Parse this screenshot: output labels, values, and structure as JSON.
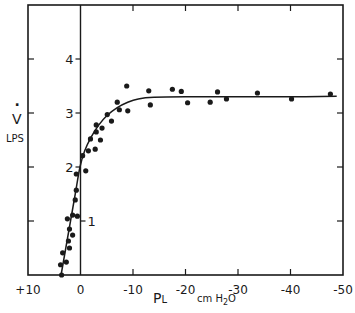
{
  "chart_data": {
    "type": "scatter",
    "title": "",
    "xlabel": "PL",
    "xlabel_subscript_note": "P with subscript L",
    "xunit": "cm H2O",
    "ylabel": "V̇",
    "yunit": "LPS",
    "xlim": [
      10,
      -50
    ],
    "ylim": [
      0,
      5
    ],
    "x_ticks": [
      10,
      0,
      -10,
      -20,
      -30,
      -40,
      -50
    ],
    "x_tick_labels": [
      "+10",
      "0",
      "-10",
      "-20",
      "-30",
      "-40",
      "-50"
    ],
    "y_ticks": [
      1,
      2,
      3,
      4
    ],
    "y_tick_labels": [
      "1",
      "2",
      "3",
      "4"
    ],
    "grid": false,
    "legend": null,
    "frame": "boxed with vertical reference line at x=0",
    "series": [
      {
        "name": "measured points",
        "kind": "scatter",
        "points": [
          [
            3.6,
            0.0
          ],
          [
            3.8,
            0.19
          ],
          [
            2.7,
            0.24
          ],
          [
            3.4,
            0.41
          ],
          [
            2.1,
            0.5
          ],
          [
            2.3,
            0.63
          ],
          [
            1.5,
            0.74
          ],
          [
            2.1,
            0.85
          ],
          [
            2.5,
            1.04
          ],
          [
            1.5,
            1.11
          ],
          [
            0.6,
            1.09
          ],
          [
            1.0,
            1.39
          ],
          [
            0.8,
            1.57
          ],
          [
            0.8,
            1.87
          ],
          [
            -1.0,
            1.93
          ],
          [
            -0.4,
            2.21
          ],
          [
            -1.5,
            2.3
          ],
          [
            -2.8,
            2.33
          ],
          [
            -3.8,
            2.5
          ],
          [
            -1.9,
            2.52
          ],
          [
            -3.0,
            2.65
          ],
          [
            -3.0,
            2.78
          ],
          [
            -4.1,
            2.72
          ],
          [
            -5.9,
            2.85
          ],
          [
            -5.1,
            2.97
          ],
          [
            -7.4,
            3.06
          ],
          [
            -7.0,
            3.2
          ],
          [
            -9.0,
            3.04
          ],
          [
            -8.8,
            3.5
          ],
          [
            -13.0,
            3.41
          ],
          [
            -13.3,
            3.15
          ],
          [
            -17.5,
            3.44
          ],
          [
            -19.2,
            3.4
          ],
          [
            -20.4,
            3.19
          ],
          [
            -24.7,
            3.2
          ],
          [
            -26.1,
            3.39
          ],
          [
            -27.8,
            3.26
          ],
          [
            -33.7,
            3.37
          ],
          [
            -40.2,
            3.26
          ],
          [
            -47.6,
            3.35
          ]
        ]
      },
      {
        "name": "fitted curve",
        "kind": "line",
        "points": [
          [
            3.7,
            0.0
          ],
          [
            2.8,
            0.5
          ],
          [
            1.9,
            1.0
          ],
          [
            1.0,
            1.5
          ],
          [
            0.1,
            2.0
          ],
          [
            -0.8,
            2.3
          ],
          [
            -2.0,
            2.55
          ],
          [
            -3.5,
            2.78
          ],
          [
            -5.0,
            2.95
          ],
          [
            -7.0,
            3.1
          ],
          [
            -9.0,
            3.2
          ],
          [
            -11.0,
            3.26
          ],
          [
            -14.0,
            3.29
          ],
          [
            -20.0,
            3.3
          ],
          [
            -30.0,
            3.3
          ],
          [
            -40.0,
            3.3
          ],
          [
            -48.8,
            3.31
          ]
        ]
      }
    ],
    "annotations": []
  },
  "labels": {
    "x_axis_name": "P",
    "x_axis_sub": "L",
    "x_unit_pre": "cm H",
    "x_unit_sub": "2",
    "x_unit_post": "O",
    "y_axis_name": "V",
    "y_axis_dot": "·",
    "y_unit": "LPS"
  },
  "colors": {
    "ink": "#1a1a1a",
    "background": "#ffffff"
  }
}
